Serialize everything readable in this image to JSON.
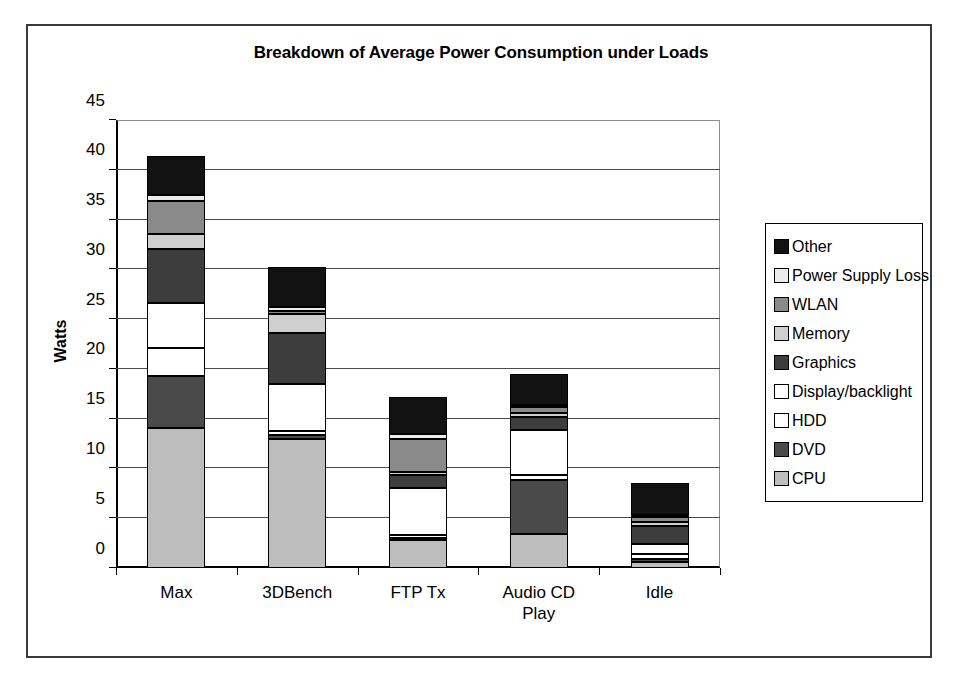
{
  "chart_data": {
    "type": "bar",
    "subtype": "stacked-bar",
    "title": "Breakdown of Average Power Consumption under Loads",
    "xlabel": "",
    "ylabel": "Watts",
    "ylim": [
      0,
      45
    ],
    "ytick_step": 5,
    "yticks": [
      "0",
      "5",
      "10",
      "15",
      "20",
      "25",
      "30",
      "35",
      "40",
      "45"
    ],
    "grid": "horizontal",
    "legend_position": "right",
    "categories": [
      "Max",
      "3DBench",
      "FTP Tx",
      "Audio CD Play",
      "Idle"
    ],
    "category_lines": [
      [
        "Max"
      ],
      [
        "3DBench"
      ],
      [
        "FTP Tx"
      ],
      [
        "Audio CD",
        "Play"
      ],
      [
        "Idle"
      ]
    ],
    "stack_order_bottom_to_top": [
      "CPU",
      "DVD",
      "HDD",
      "Display/backlight",
      "Graphics",
      "Memory",
      "WLAN",
      "Power Supply Loss",
      "Other"
    ],
    "series": [
      {
        "name": "CPU",
        "color": "#bdbdbd",
        "values": [
          14.1,
          13.0,
          2.8,
          3.4,
          0.6
        ]
      },
      {
        "name": "DVD",
        "color": "#4a4a4a",
        "values": [
          5.2,
          0.4,
          0.2,
          5.4,
          0.3
        ]
      },
      {
        "name": "HDD",
        "color": "#ffffff",
        "values": [
          2.8,
          0.4,
          0.3,
          0.5,
          0.5
        ]
      },
      {
        "name": "Display/backlight",
        "color": "#ffffff",
        "values": [
          4.5,
          4.7,
          4.7,
          4.6,
          1.0
        ]
      },
      {
        "name": "Graphics",
        "color": "#3d3d3d",
        "values": [
          5.4,
          5.1,
          1.3,
          1.3,
          1.8
        ]
      },
      {
        "name": "Memory",
        "color": "#cfcfcf",
        "values": [
          1.6,
          1.9,
          0.3,
          0.4,
          0.4
        ]
      },
      {
        "name": "WLAN",
        "color": "#8a8a8a",
        "values": [
          3.3,
          0.3,
          3.4,
          0.6,
          0.5
        ]
      },
      {
        "name": "Power Supply Loss",
        "color": "#ebebeb",
        "values": [
          0.6,
          0.4,
          0.5,
          0.2,
          0.2
        ]
      },
      {
        "name": "Other",
        "color": "#121212",
        "values": [
          3.9,
          4.0,
          3.7,
          3.1,
          3.2
        ]
      }
    ],
    "totals": [
      41.4,
      30.2,
      17.2,
      19.5,
      8.5
    ]
  },
  "legend": {
    "items": [
      {
        "label": "Other",
        "color": "#121212"
      },
      {
        "label": "Power Supply Loss",
        "color": "#ebebeb"
      },
      {
        "label": "WLAN",
        "color": "#8a8a8a"
      },
      {
        "label": "Memory",
        "color": "#cfcfcf"
      },
      {
        "label": "Graphics",
        "color": "#3d3d3d"
      },
      {
        "label": "Display/backlight",
        "color": "#ffffff"
      },
      {
        "label": "HDD",
        "color": "#ffffff"
      },
      {
        "label": "DVD",
        "color": "#4a4a4a"
      },
      {
        "label": "CPU",
        "color": "#bdbdbd"
      }
    ]
  }
}
